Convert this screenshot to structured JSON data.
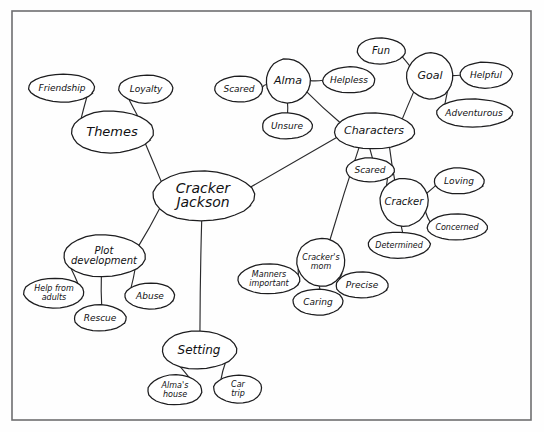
{
  "diagram": {
    "type": "concept-map",
    "style": "hand-drawn pencil sketch on white paper with drawn rectangular border",
    "border": {
      "x": 12,
      "y": 11,
      "width": 519,
      "height": 409,
      "color": "#6e6e70"
    },
    "ink_color": "#1d1d1f",
    "paper_color": "#fefefe",
    "nodes": [
      {
        "id": "cracker_jackson",
        "label": "Cracker\nJackson",
        "cx": 203,
        "cy": 196,
        "rx": 51,
        "ry": 25,
        "fs": 14,
        "role": "root"
      },
      {
        "id": "themes",
        "label": "Themes",
        "cx": 112,
        "cy": 132,
        "rx": 41,
        "ry": 21,
        "fs": 13,
        "role": "branch"
      },
      {
        "id": "friendship",
        "label": "Friendship",
        "cx": 62,
        "cy": 88,
        "rx": 33,
        "ry": 14,
        "fs": 9,
        "role": "leaf"
      },
      {
        "id": "loyalty",
        "label": "Loyalty",
        "cx": 146,
        "cy": 89,
        "rx": 27,
        "ry": 14,
        "fs": 9,
        "role": "leaf"
      },
      {
        "id": "plot_development",
        "label": "Plot\ndevelopment",
        "cx": 104,
        "cy": 256,
        "rx": 41,
        "ry": 21,
        "fs": 10,
        "role": "branch"
      },
      {
        "id": "help_from_adults",
        "label": "Help from\nadults",
        "cx": 54,
        "cy": 293,
        "rx": 30,
        "ry": 15,
        "fs": 8,
        "role": "leaf"
      },
      {
        "id": "rescue",
        "label": "Rescue",
        "cx": 100,
        "cy": 318,
        "rx": 26,
        "ry": 13,
        "fs": 9,
        "role": "leaf"
      },
      {
        "id": "abuse",
        "label": "Abuse",
        "cx": 150,
        "cy": 296,
        "rx": 25,
        "ry": 13,
        "fs": 9,
        "role": "leaf"
      },
      {
        "id": "setting",
        "label": "Setting",
        "cx": 199,
        "cy": 350,
        "rx": 37,
        "ry": 19,
        "fs": 12,
        "role": "branch"
      },
      {
        "id": "almas_house",
        "label": "Alma's\nhouse",
        "cx": 175,
        "cy": 390,
        "rx": 27,
        "ry": 15,
        "fs": 8,
        "role": "leaf"
      },
      {
        "id": "car_trip",
        "label": "Car\ntrip",
        "cx": 238,
        "cy": 389,
        "rx": 24,
        "ry": 14,
        "fs": 8,
        "role": "leaf"
      },
      {
        "id": "characters",
        "label": "Characters",
        "cx": 374,
        "cy": 131,
        "rx": 40,
        "ry": 18,
        "fs": 11,
        "role": "branch"
      },
      {
        "id": "alma",
        "label": "Alma",
        "cx": 288,
        "cy": 81,
        "rx": 22,
        "ry": 22,
        "fs": 11,
        "role": "branch"
      },
      {
        "id": "scared_alma",
        "label": "Scared",
        "cx": 239,
        "cy": 89,
        "rx": 24,
        "ry": 13,
        "fs": 9,
        "role": "leaf"
      },
      {
        "id": "helpless",
        "label": "Helpless",
        "cx": 349,
        "cy": 80,
        "rx": 26,
        "ry": 13,
        "fs": 9,
        "role": "leaf"
      },
      {
        "id": "unsure",
        "label": "Unsure",
        "cx": 287,
        "cy": 126,
        "rx": 25,
        "ry": 13,
        "fs": 9,
        "role": "leaf"
      },
      {
        "id": "goal",
        "label": "Goal",
        "cx": 430,
        "cy": 76,
        "rx": 23,
        "ry": 23,
        "fs": 11,
        "role": "branch"
      },
      {
        "id": "fun",
        "label": "Fun",
        "cx": 381,
        "cy": 51,
        "rx": 24,
        "ry": 13,
        "fs": 10,
        "role": "leaf"
      },
      {
        "id": "helpful",
        "label": "Helpful",
        "cx": 486,
        "cy": 75,
        "rx": 26,
        "ry": 13,
        "fs": 9,
        "role": "leaf"
      },
      {
        "id": "adventurous",
        "label": "Adventurous",
        "cx": 474,
        "cy": 113,
        "rx": 38,
        "ry": 14,
        "fs": 9,
        "role": "leaf"
      },
      {
        "id": "scared_cracker",
        "label": "Scared",
        "cx": 370,
        "cy": 170,
        "rx": 24,
        "ry": 12,
        "fs": 9,
        "role": "leaf"
      },
      {
        "id": "cracker",
        "label": "Cracker",
        "cx": 404,
        "cy": 202,
        "rx": 24,
        "ry": 24,
        "fs": 10,
        "role": "branch"
      },
      {
        "id": "loving",
        "label": "Loving",
        "cx": 459,
        "cy": 181,
        "rx": 25,
        "ry": 13,
        "fs": 9,
        "role": "leaf"
      },
      {
        "id": "concerned",
        "label": "Concerned",
        "cx": 457,
        "cy": 227,
        "rx": 30,
        "ry": 13,
        "fs": 8,
        "role": "leaf"
      },
      {
        "id": "determined",
        "label": "Determined",
        "cx": 399,
        "cy": 245,
        "rx": 31,
        "ry": 13,
        "fs": 8,
        "role": "leaf"
      },
      {
        "id": "crackers_mom",
        "label": "Cracker's\nmom",
        "cx": 321,
        "cy": 262,
        "rx": 24,
        "ry": 24,
        "fs": 8,
        "role": "branch"
      },
      {
        "id": "manners_important",
        "label": "Manners\nimportant",
        "cx": 269,
        "cy": 279,
        "rx": 31,
        "ry": 15,
        "fs": 8,
        "role": "leaf"
      },
      {
        "id": "caring",
        "label": "Caring",
        "cx": 318,
        "cy": 302,
        "rx": 25,
        "ry": 13,
        "fs": 9,
        "role": "leaf"
      },
      {
        "id": "precise",
        "label": "Precise",
        "cx": 362,
        "cy": 285,
        "rx": 26,
        "ry": 13,
        "fs": 9,
        "role": "leaf"
      }
    ],
    "edges": [
      {
        "from": "cracker_jackson",
        "to": "themes"
      },
      {
        "from": "cracker_jackson",
        "to": "plot_development"
      },
      {
        "from": "cracker_jackson",
        "to": "setting"
      },
      {
        "from": "cracker_jackson",
        "to": "characters"
      },
      {
        "from": "themes",
        "to": "friendship"
      },
      {
        "from": "themes",
        "to": "loyalty"
      },
      {
        "from": "plot_development",
        "to": "help_from_adults"
      },
      {
        "from": "plot_development",
        "to": "rescue"
      },
      {
        "from": "plot_development",
        "to": "abuse"
      },
      {
        "from": "setting",
        "to": "almas_house"
      },
      {
        "from": "setting",
        "to": "car_trip"
      },
      {
        "from": "characters",
        "to": "alma"
      },
      {
        "from": "characters",
        "to": "goal"
      },
      {
        "from": "characters",
        "to": "scared_cracker"
      },
      {
        "from": "characters",
        "to": "cracker"
      },
      {
        "from": "characters",
        "to": "crackers_mom"
      },
      {
        "from": "alma",
        "to": "scared_alma"
      },
      {
        "from": "alma",
        "to": "helpless"
      },
      {
        "from": "alma",
        "to": "unsure"
      },
      {
        "from": "goal",
        "to": "fun"
      },
      {
        "from": "goal",
        "to": "helpful"
      },
      {
        "from": "goal",
        "to": "adventurous"
      },
      {
        "from": "cracker",
        "to": "scared_cracker"
      },
      {
        "from": "cracker",
        "to": "loving"
      },
      {
        "from": "cracker",
        "to": "concerned"
      },
      {
        "from": "cracker",
        "to": "determined"
      },
      {
        "from": "crackers_mom",
        "to": "manners_important"
      },
      {
        "from": "crackers_mom",
        "to": "caring"
      },
      {
        "from": "crackers_mom",
        "to": "precise"
      }
    ]
  }
}
